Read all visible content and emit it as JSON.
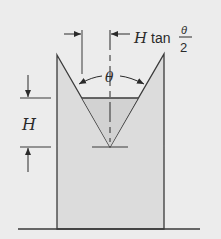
{
  "figure": {
    "labels": {
      "height": "H",
      "angle": "θ",
      "half_width_prefix": "H",
      "half_width_func": "tan",
      "half_width_num": "θ",
      "half_width_den": "2"
    },
    "colors": {
      "background": "#ececec",
      "plate_fill": "#dcdcdc",
      "water_fill": "#d2d2d2",
      "line": "#3a3a3a"
    }
  }
}
